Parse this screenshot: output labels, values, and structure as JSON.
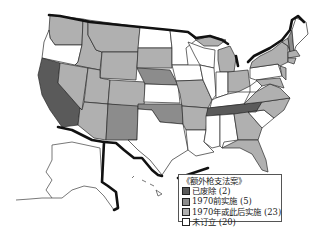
{
  "legend": {
    "title": "《额外枪支法案》",
    "items": [
      {
        "label": "已废除 (2)",
        "category": "repealed",
        "color": "#5a5a5a"
      },
      {
        "label": "1970前实施 (5)",
        "category": "before-1970",
        "color": "#8c8c8c"
      },
      {
        "label": "1970年或此后实施 (23)",
        "category": "1970-or-later",
        "color": "#b0b0b0"
      },
      {
        "label": "未订立 (20)",
        "category": "not-enacted",
        "color": "#ffffff"
      }
    ]
  },
  "map": {
    "colors": {
      "repealed": "#5a5a5a",
      "before_1970": "#8c8c8c",
      "after_1970": "#b0b0b0",
      "none": "#ffffff",
      "border": "#111111"
    },
    "states": [
      {
        "id": "WA",
        "category": "1970-or-later"
      },
      {
        "id": "OR",
        "category": "not-enacted"
      },
      {
        "id": "CA",
        "category": "repealed"
      },
      {
        "id": "TN",
        "category": "repealed"
      },
      {
        "id": "NE",
        "category": "before-1970"
      },
      {
        "id": "OK",
        "category": "before-1970"
      },
      {
        "id": "NM",
        "category": "before-1970"
      }
    ]
  }
}
